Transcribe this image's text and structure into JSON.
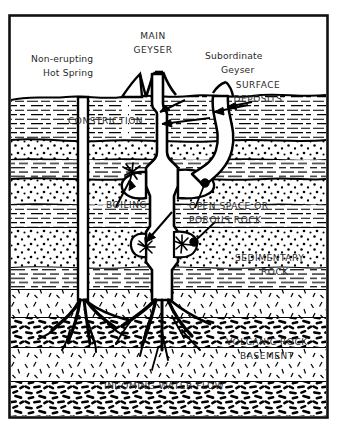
{
  "figure": {
    "frame_color": "#111111",
    "background_color": "#ffffff",
    "ink_color": "#000000",
    "label_color": "#2b2b2b"
  },
  "labels": {
    "non_erupting_hot_spring_line1": "Non-erupting",
    "non_erupting_hot_spring_line2": "Hot Spring",
    "main_geyser_line1": "MAIN",
    "main_geyser_line2": "GEYSER",
    "subordinate_geyser_line1": "Subordinate",
    "subordinate_geyser_line2": "Geyser",
    "surface_deposits_line1": "SURFACE",
    "surface_deposits_line2": "DEPOSITS",
    "constriction": "CONSTRICTION",
    "boiling": "BOILING",
    "open_space_line1": "OPEN SPACE OR",
    "open_space_line2": "POROUS ROCK",
    "sedimentary_rock_line1": "SEDIMENTARY",
    "sedimentary_rock_line2": "ROCK",
    "volcanic_rock_line1": "VOLCANIC ROCK",
    "volcanic_rock_line2": "BASEMENT",
    "incoming_water_flow": "INCOMING WATER FLOW"
  },
  "strata": [
    {
      "name": "shale-upper-1",
      "pattern": "horizontal-dashes",
      "top": 96,
      "bottom": 139
    },
    {
      "name": "sandstone-dotted-1",
      "pattern": "dots",
      "top": 139,
      "bottom": 160
    },
    {
      "name": "shale-2",
      "pattern": "horizontal-dashes",
      "top": 160,
      "bottom": 178
    },
    {
      "name": "sandstone-dotted-2",
      "pattern": "dots",
      "top": 178,
      "bottom": 205
    },
    {
      "name": "shale-3",
      "pattern": "horizontal-dashes",
      "top": 205,
      "bottom": 228
    },
    {
      "name": "sandstone-dotted-3",
      "pattern": "dots",
      "top": 228,
      "bottom": 268
    },
    {
      "name": "shale-4",
      "pattern": "horizontal-dashes",
      "top": 268,
      "bottom": 290
    },
    {
      "name": "volcanic-tuff-1",
      "pattern": "sparse-ticks",
      "top": 290,
      "bottom": 318
    },
    {
      "name": "volcanic-basement-1",
      "pattern": "dense-blobs",
      "top": 318,
      "bottom": 348
    },
    {
      "name": "volcanic-tuff-2",
      "pattern": "sparse-ticks",
      "top": 348,
      "bottom": 382
    },
    {
      "name": "volcanic-basement-2",
      "pattern": "dense-blobs",
      "top": 382,
      "bottom": 416
    }
  ],
  "features": [
    {
      "name": "non-erupting-hot-spring-conduit",
      "kind": "vertical-conduit",
      "x": 83
    },
    {
      "name": "main-geyser-conduit",
      "kind": "vertical-conduit",
      "x": 163
    },
    {
      "name": "subordinate-geyser-conduit",
      "kind": "curved-conduit",
      "x": 222
    },
    {
      "name": "constriction-point",
      "kind": "narrowing",
      "x": 163,
      "y": 112
    },
    {
      "name": "boiling-burst-upper",
      "kind": "starburst",
      "x": 130,
      "y": 170
    },
    {
      "name": "boiling-burst-lower-left",
      "kind": "starburst",
      "x": 148,
      "y": 255
    },
    {
      "name": "boiling-burst-lower-right",
      "kind": "starburst",
      "x": 186,
      "y": 252
    },
    {
      "name": "open-space-chamber",
      "kind": "cavity",
      "x": 175,
      "y": 180
    }
  ]
}
